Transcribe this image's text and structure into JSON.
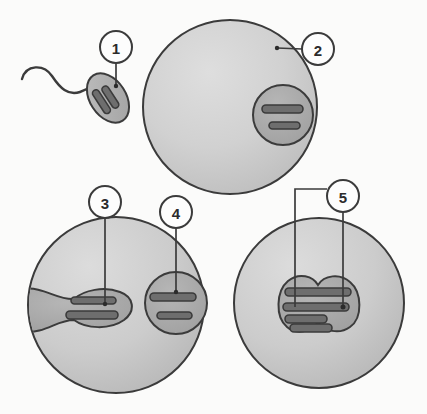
{
  "figure": {
    "background_color": "#fbfbfa",
    "outline_color": "#3b3b3b",
    "cell_fill_light": "#d2d2d2",
    "cell_fill_mid": "#c4c4c4",
    "nucleus_fill": "#a9a9a9",
    "chromosome_fill": "#6e6e6e",
    "callout_fill": "#fdfdfd",
    "callout_text_color": "#2b2b2b"
  },
  "callouts": [
    {
      "id": "callout-1",
      "label": "1",
      "cx": 116,
      "cy": 47,
      "r": 16,
      "target_x": 116,
      "target_y": 86,
      "describes": "sperm-nucleus"
    },
    {
      "id": "callout-2",
      "label": "2",
      "cx": 318,
      "cy": 49,
      "r": 16,
      "target_x": 277,
      "target_y": 48,
      "describes": "egg-cell-membrane"
    },
    {
      "id": "callout-3",
      "label": "3",
      "cx": 105,
      "cy": 202,
      "r": 16,
      "target_x": 105,
      "target_y": 305,
      "describes": "sperm-pronucleus-in-egg"
    },
    {
      "id": "callout-4",
      "label": "4",
      "cx": 176,
      "cy": 212,
      "r": 16,
      "target_x": 176,
      "target_y": 293,
      "describes": "egg-pronucleus"
    },
    {
      "id": "callout-5",
      "label": "5",
      "cx": 343,
      "cy": 196,
      "r": 16,
      "target_x_left": 295,
      "target_x_right": 343,
      "target_y": 307,
      "describes": "fused-zygote-chromosomes"
    }
  ],
  "panels": [
    {
      "id": "panel-sperm",
      "name": "sperm-cell",
      "parts": [
        "flagellum",
        "sperm-head",
        "sperm-chromosomes"
      ],
      "chromosome_count": 2
    },
    {
      "id": "panel-egg",
      "name": "egg-cell",
      "center_x": 230,
      "center_y": 107,
      "radius": 87,
      "nucleus_center_x": 283,
      "nucleus_center_y": 115,
      "nucleus_radius": 30,
      "chromosome_count": 2
    },
    {
      "id": "panel-fusion",
      "name": "fertilized-egg-two-pronuclei",
      "center_x": 116,
      "center_y": 305,
      "radius": 88,
      "chromosome_count": 4
    },
    {
      "id": "panel-zygote",
      "name": "zygote-fused-nucleus",
      "center_x": 319,
      "center_y": 303,
      "radius": 85,
      "chromosome_count": 4
    }
  ]
}
